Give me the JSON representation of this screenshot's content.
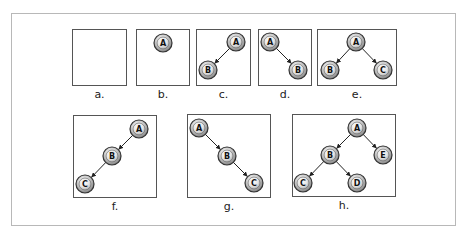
{
  "panels": [
    {
      "id": "a",
      "caption": "a.",
      "box": [
        72,
        29,
        55,
        57
      ],
      "nodes": [],
      "edges": []
    },
    {
      "id": "b",
      "caption": "b.",
      "box": [
        136,
        29,
        54,
        57
      ],
      "nodes": [
        {
          "id": "A",
          "x": 163,
          "y": 43
        }
      ],
      "edges": []
    },
    {
      "id": "c",
      "caption": "c.",
      "box": [
        196,
        29,
        55,
        57
      ],
      "nodes": [
        {
          "id": "A",
          "x": 236,
          "y": 42
        },
        {
          "id": "B",
          "x": 208,
          "y": 70
        }
      ],
      "edges": [
        [
          "A",
          "B"
        ]
      ]
    },
    {
      "id": "d",
      "caption": "d.",
      "box": [
        258,
        29,
        54,
        57
      ],
      "nodes": [
        {
          "id": "A",
          "x": 270,
          "y": 42
        },
        {
          "id": "B",
          "x": 298,
          "y": 70
        }
      ],
      "edges": [
        [
          "A",
          "B"
        ]
      ]
    },
    {
      "id": "e",
      "caption": "e.",
      "box": [
        317,
        29,
        80,
        57
      ],
      "nodes": [
        {
          "id": "A",
          "x": 356,
          "y": 42
        },
        {
          "id": "B",
          "x": 330,
          "y": 70
        },
        {
          "id": "C",
          "x": 383,
          "y": 70
        }
      ],
      "edges": [
        [
          "A",
          "B"
        ],
        [
          "A",
          "C"
        ]
      ]
    },
    {
      "id": "f",
      "caption": "f.",
      "box": [
        73,
        115,
        84,
        83
      ],
      "nodes": [
        {
          "id": "A",
          "x": 139,
          "y": 129
        },
        {
          "id": "B",
          "x": 112,
          "y": 156
        },
        {
          "id": "C",
          "x": 85,
          "y": 184
        }
      ],
      "edges": [
        [
          "A",
          "B"
        ],
        [
          "B",
          "C"
        ]
      ]
    },
    {
      "id": "g",
      "caption": "g.",
      "box": [
        187,
        114,
        84,
        84
      ],
      "nodes": [
        {
          "id": "A",
          "x": 199,
          "y": 128
        },
        {
          "id": "B",
          "x": 227,
          "y": 156
        },
        {
          "id": "C",
          "x": 254,
          "y": 183
        }
      ],
      "edges": [
        [
          "A",
          "B"
        ],
        [
          "B",
          "C"
        ]
      ]
    },
    {
      "id": "h",
      "caption": "h.",
      "box": [
        292,
        114,
        104,
        83
      ],
      "nodes": [
        {
          "id": "A",
          "x": 357,
          "y": 128
        },
        {
          "id": "B",
          "x": 330,
          "y": 155
        },
        {
          "id": "E",
          "x": 383,
          "y": 155
        },
        {
          "id": "C",
          "x": 303,
          "y": 183
        },
        {
          "id": "D",
          "x": 357,
          "y": 183
        }
      ],
      "edges": [
        [
          "A",
          "B"
        ],
        [
          "A",
          "E"
        ],
        [
          "B",
          "C"
        ],
        [
          "B",
          "D"
        ]
      ]
    }
  ],
  "style": {
    "node_radius": 9,
    "edge_color": "#222222",
    "node_border": "#333333",
    "node_fill_center": "#f4f4f4",
    "node_fill_edge": "#8a8a8a",
    "frame_color": "#b8b8b8"
  }
}
